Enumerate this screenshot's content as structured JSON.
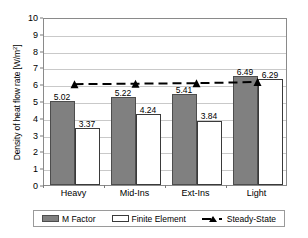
{
  "chart_data": {
    "type": "bar",
    "title": "",
    "xlabel": "",
    "ylabel": "Density of heat flow rate [W/m",
    "ylabel_superscript": "2",
    "ylabel_suffix": "]",
    "categories": [
      "Heavy",
      "Mid-Ins",
      "Ext-Ins",
      "Light"
    ],
    "ylim": [
      0,
      10
    ],
    "ytick_step": 1,
    "yticks": [
      "0",
      "1",
      "2",
      "3",
      "4",
      "5",
      "6",
      "7",
      "8",
      "9",
      "10"
    ],
    "grid": true,
    "legend_position": "bottom",
    "series": [
      {
        "name": "M Factor",
        "type": "bar",
        "color": "#808080",
        "values": [
          5.02,
          5.22,
          5.41,
          6.49
        ],
        "labels": [
          "5.02",
          "5.22",
          "5.41",
          "6.49"
        ]
      },
      {
        "name": "Finite Element",
        "type": "bar",
        "color": "#ffffff",
        "values": [
          3.37,
          4.24,
          3.84,
          6.29
        ],
        "labels": [
          "3.37",
          "4.24",
          "3.84",
          "6.29"
        ]
      },
      {
        "name": "Steady-State",
        "type": "line",
        "color": "#000000",
        "style": "dashed-with-triangle-markers",
        "values": [
          6.12,
          6.15,
          6.18,
          6.25
        ],
        "labels": [
          "",
          "",
          "",
          ""
        ]
      }
    ]
  },
  "legend": {
    "items": [
      {
        "label": "M Factor",
        "swatch": "filled-gray-swatch"
      },
      {
        "label": "Finite Element",
        "swatch": "outlined-white-swatch"
      },
      {
        "label": "Steady-State",
        "swatch": "dashed-line-triangle-marker"
      }
    ]
  }
}
